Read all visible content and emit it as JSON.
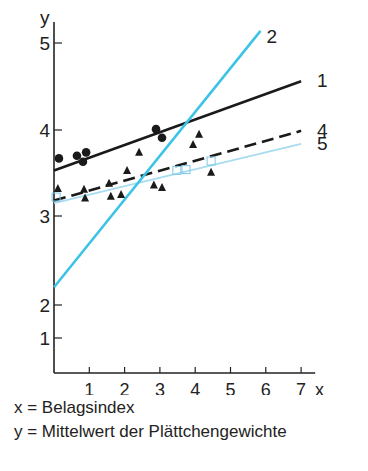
{
  "chart_data": {
    "type": "line",
    "title": "",
    "xlabel": "x",
    "ylabel": "y",
    "x_ticks": [
      "1",
      "2",
      "3",
      "4",
      "5",
      "6",
      "7"
    ],
    "y_ticks": [
      "1",
      "2",
      "3",
      "4",
      "5"
    ],
    "xlim": [
      0,
      7.4
    ],
    "ylim": [
      0.6,
      5.2
    ],
    "grid": false,
    "series": [
      {
        "name": "1",
        "style": "solid",
        "color": "#1a1a1a",
        "points": [
          [
            0,
            3.53
          ],
          [
            7.0,
            4.56
          ]
        ]
      },
      {
        "name": "2",
        "style": "solid",
        "color": "#3cc3e6",
        "points": [
          [
            0,
            2.2
          ],
          [
            5.85,
            5.14
          ]
        ]
      },
      {
        "name": "4",
        "style": "dashed",
        "color": "#1a1a1a",
        "points": [
          [
            0,
            3.18
          ],
          [
            7.0,
            3.99
          ]
        ]
      },
      {
        "name": "5",
        "style": "solid",
        "color": "#a8dcf0",
        "points": [
          [
            0,
            3.15
          ],
          [
            7.0,
            3.84
          ]
        ]
      }
    ],
    "scatter": {
      "circles": [
        [
          0.14,
          3.67
        ],
        [
          0.65,
          3.7
        ],
        [
          0.91,
          3.74
        ],
        [
          0.82,
          3.63
        ],
        [
          2.89,
          4.01
        ],
        [
          3.06,
          3.91
        ]
      ],
      "triangles": [
        [
          0.11,
          3.32
        ],
        [
          0.85,
          3.31
        ],
        [
          0.88,
          3.21
        ],
        [
          1.56,
          3.38
        ],
        [
          1.61,
          3.23
        ],
        [
          1.9,
          3.25
        ],
        [
          2.07,
          3.53
        ],
        [
          2.41,
          3.74
        ],
        [
          2.83,
          3.36
        ],
        [
          3.06,
          3.33
        ],
        [
          3.94,
          3.83
        ],
        [
          4.11,
          3.95
        ],
        [
          4.45,
          3.51
        ]
      ],
      "squares": [
        [
          0.06,
          3.22
        ],
        [
          3.48,
          3.53
        ],
        [
          3.74,
          3.54
        ],
        [
          4.45,
          3.64
        ]
      ]
    },
    "legend": "line-end labels"
  },
  "captions": {
    "x_def": "x = Belagsindex",
    "y_def": "y = Mittelwert der Plättchengewichte"
  }
}
